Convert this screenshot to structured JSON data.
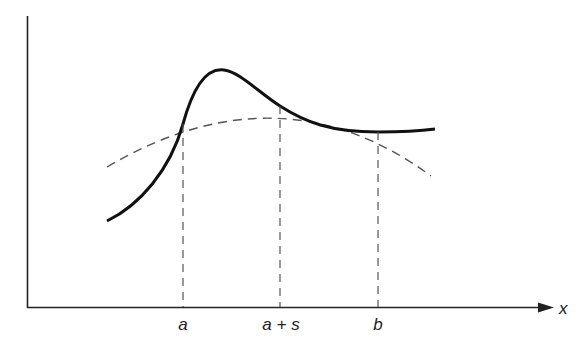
{
  "diagram": {
    "axes": {
      "x_label": "x",
      "color": "#222222"
    },
    "tick_labels": {
      "a": "a",
      "a_plus_s": "a + s",
      "b": "b"
    },
    "curves": {
      "solid": {
        "name": "f(x)",
        "style": "solid",
        "color": "#111111"
      },
      "dashed": {
        "name": "approximating parabola",
        "style": "dashed",
        "color": "#555555"
      }
    },
    "intersections": [
      {
        "label": "a",
        "x_px": 183,
        "y_px": 124
      },
      {
        "label": "a + s",
        "x_px": 280,
        "y_px": 106
      },
      {
        "label": "b",
        "x_px": 378,
        "y_px": 132
      }
    ]
  }
}
